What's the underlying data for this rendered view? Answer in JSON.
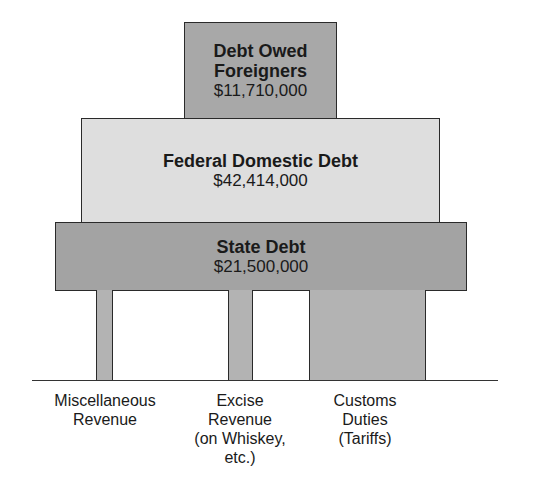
{
  "diagram": {
    "levels": [
      {
        "title_line1": "Debt Owed",
        "title_line2": "Foreigners",
        "amount": "$11,710,000"
      },
      {
        "title": "Federal Domestic Debt",
        "amount": "$42,414,000"
      },
      {
        "title": "State Debt",
        "amount": "$21,500,000"
      }
    ],
    "pillars": [
      {
        "lines": [
          "Miscellaneous",
          "Revenue"
        ]
      },
      {
        "lines": [
          "Excise",
          "Revenue",
          "(on Whiskey,",
          "etc.)"
        ]
      },
      {
        "lines": [
          "Customs",
          "Duties",
          "(Tariffs)"
        ]
      }
    ],
    "colors": {
      "dark_gray": "#a8a8a8",
      "light_gray": "#dedede",
      "outline": "#2a2a2a"
    }
  }
}
